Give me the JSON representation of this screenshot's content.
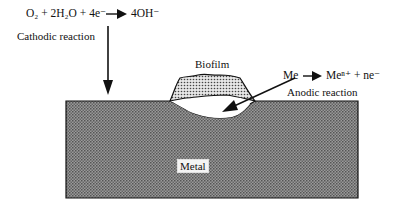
{
  "diagram": {
    "cathodic": {
      "equation_left": "O₂ + 2H₂O + 4e⁻",
      "equation_right": "4OH⁻",
      "label": "Cathodic reaction"
    },
    "anodic": {
      "equation_left": "Me",
      "equation_right": "Meⁿ⁺ + ne⁻",
      "label": "Anodic reaction"
    },
    "biofilm_label": "Biofilm",
    "metal_label": "Metal",
    "colors": {
      "metal_fill": "#8a8a8a",
      "biofilm_fill": "#c8c8c8",
      "outline": "#111111",
      "background": "#ffffff"
    }
  }
}
